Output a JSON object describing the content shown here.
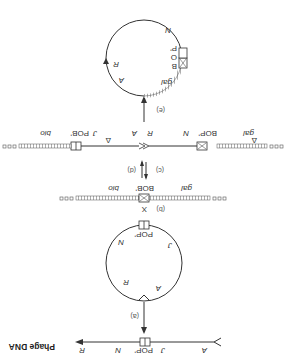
{
  "title": "Phage DNA",
  "steps": {
    "a": "(a)",
    "b": "(b)",
    "c": "(c)",
    "d": "(d)",
    "e": "(e)"
  },
  "linear_phage": {
    "genes": [
      "A",
      "J",
      "N",
      "R"
    ],
    "site": "POP'"
  },
  "circular_phage": {
    "genes": [
      "A",
      "R",
      "J",
      "N"
    ],
    "site": "POP'"
  },
  "bacterial_chromosome": {
    "left_gene": "gal",
    "right_gene": "bio",
    "site": "BOB'",
    "cross_symbol": "X"
  },
  "integrated_prophage": {
    "left_gene": "gal",
    "right_gene": "bio",
    "left_site": "BOP'",
    "right_site": "POB'",
    "genes": [
      "N",
      "R",
      "A",
      "J"
    ],
    "delta_symbol": "Δ"
  },
  "excised_circle": {
    "site_labels": [
      "B",
      "O",
      "P'"
    ],
    "genes": [
      "N",
      "R",
      "A",
      "gal"
    ]
  },
  "colors": {
    "line": "#333333",
    "bacterial_hatch": "#777777",
    "background": "#ffffff"
  }
}
